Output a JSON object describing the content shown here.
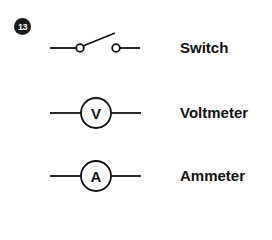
{
  "figure_number": "13",
  "symbols": [
    {
      "name": "switch",
      "label": "Switch"
    },
    {
      "name": "voltmeter",
      "label": "Voltmeter",
      "glyph": "V"
    },
    {
      "name": "ammeter",
      "label": "Ammeter",
      "glyph": "A"
    }
  ],
  "colors": {
    "stroke": "#111111",
    "badge": "#1a1a1a"
  }
}
